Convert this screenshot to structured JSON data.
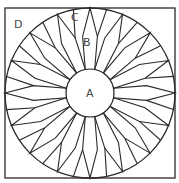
{
  "diagram": {
    "labels": {
      "A": "A",
      "B": "B",
      "C": "C",
      "D": "D"
    },
    "petal_count": 16,
    "colors": {
      "stroke": "#2a2a2a",
      "fill": "#ffffff",
      "text": "#444444"
    }
  }
}
